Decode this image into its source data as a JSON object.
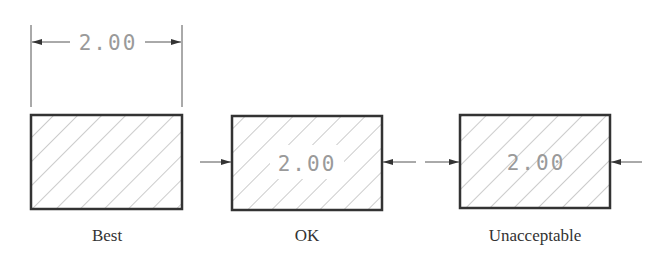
{
  "diagram": {
    "dimension_value": "2.00",
    "panels": [
      {
        "label": "Best",
        "placement": "dimension outside the section, with extension lines"
      },
      {
        "label": "OK",
        "placement": "dimension inside section with hatching cleared around text"
      },
      {
        "label": "Unacceptable",
        "placement": "dimension inside section with hatching running through text"
      }
    ],
    "colors": {
      "outline": "#333333",
      "hatch": "#9a9a9a",
      "dim_text": "#9a9a9a",
      "label": "#333333"
    }
  }
}
